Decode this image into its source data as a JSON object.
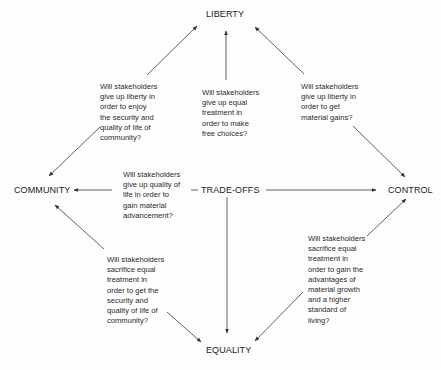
{
  "nodes": {
    "liberty": "LIBERTY",
    "community": "COMMUNITY",
    "control": "CONTROL",
    "equality": "EQUALITY",
    "center": "TRADE-OFFS"
  },
  "questions": {
    "liberty_community": "Will stakeholders\ngive up liberty in\norder to enjoy\nthe security and\nquality of life of\ncommunity?",
    "equality_liberty": "Will stakeholders\ngive up equal\ntreatment in\norder to make\nfree choices?",
    "liberty_control": "Will stakeholders\ngive up liberty in\norder to get\nmaterial gains?",
    "community_control": "Will stakeholders\ngive up quality of\nlife in order to\ngain material\nadvancement?",
    "equality_community": "Will stakeholders\nsacrifice equal\ntreatment in\norder to get the\nsecurity and\nquality of life of\ncommunity?",
    "equality_control": "Will stakeholders\nsacrifice equal\ntreatment in\norder to gain the\nadvantages of\nmaterial growth\nand a higher\nstandard of\nliving?"
  },
  "colors": {
    "line": "#3a3a3a",
    "text": "#222222",
    "background": "#fdfdfd"
  }
}
